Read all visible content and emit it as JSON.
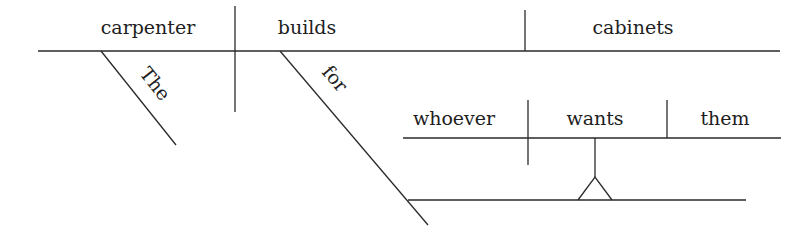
{
  "diagram": {
    "type": "reed-kellogg-sentence-diagram",
    "sentence": "The carpenter builds cabinets for whoever wants them",
    "main_clause": {
      "subject": "carpenter",
      "verb": "builds",
      "direct_object": "cabinets",
      "subject_modifier": "The",
      "verb_modifier_preposition": "for"
    },
    "noun_clause": {
      "subject": "whoever",
      "verb": "wants",
      "direct_object": "them"
    },
    "colors": {
      "line": "#2a2a2a",
      "text": "#1e1e1e",
      "background": "#ffffff"
    }
  }
}
